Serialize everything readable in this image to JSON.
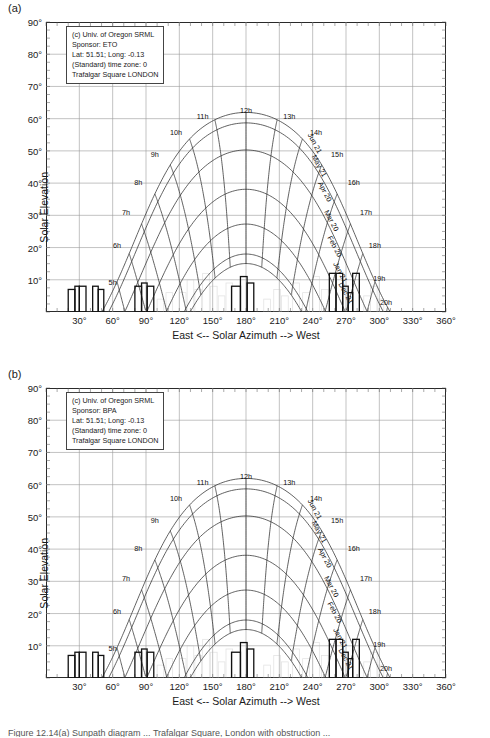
{
  "figure": {
    "caption": "Figure 12.14(a) Sunpath diagram ... Trafalgar Square, London with obstruction ..."
  },
  "panels": [
    {
      "letter": "(a)",
      "info": [
        "(c) Univ. of Oregon SRML",
        "Sponsor: ETO",
        "Lat: 51.51; Long: -0.13",
        "(Standard) time zone: 0",
        "Trafalgar Square LONDON"
      ]
    },
    {
      "letter": "(b)",
      "info": [
        "(c) Univ. of Oregon SRML",
        "Sponsor: BPA",
        "Lat: 51.51; Long: -0.13",
        "(Standard) time zone: 0",
        "Trafalgar Square LONDON"
      ]
    }
  ],
  "axes": {
    "ylabel": "Solar Elevation",
    "xlabel": "East <-- Solar Azimuth --> West",
    "yticks": [
      "90°",
      "80°",
      "70°",
      "60°",
      "50°",
      "40°",
      "30°",
      "20°",
      "10°"
    ],
    "yvalues": [
      90,
      80,
      70,
      60,
      50,
      40,
      30,
      20,
      10
    ],
    "xticks": [
      "30°",
      "60°",
      "90°",
      "120°",
      "150°",
      "180°",
      "210°",
      "240°",
      "270°",
      "300°",
      "330°",
      "360°"
    ],
    "xvalues": [
      30,
      60,
      90,
      120,
      150,
      180,
      210,
      240,
      270,
      300,
      330,
      360
    ],
    "xlim": [
      0,
      360
    ],
    "ylim": [
      0,
      90
    ]
  },
  "chart_data": {
    "type": "line",
    "xlabel": "East <-- Solar Azimuth --> West",
    "ylabel": "Solar Elevation",
    "xlim": [
      0,
      360
    ],
    "ylim": [
      0,
      90
    ],
    "grid": true,
    "legend": "none",
    "latitude": 51.51,
    "longitude": -0.13,
    "timezone": 0,
    "hour_labels": [
      "5h",
      "6h",
      "7h",
      "8h",
      "9h",
      "10h",
      "11h",
      "12h",
      "13h",
      "14h",
      "15h",
      "16h",
      "17h",
      "18h",
      "19h",
      "20h"
    ],
    "month_labels": [
      "Jun 21",
      "May 21",
      "Apr 20",
      "Mar 20",
      "Feb 20",
      "Jan 21",
      "Dec 21"
    ],
    "declinations": [
      23.45,
      20.2,
      11.8,
      -0.4,
      -11.2,
      -20.5,
      -23.45
    ],
    "obstruction_bars": [
      {
        "azimuth_start": 20,
        "azimuth_end": 26,
        "elevation": 7
      },
      {
        "azimuth_start": 26,
        "azimuth_end": 30,
        "elevation": 8
      },
      {
        "azimuth_start": 30,
        "azimuth_end": 36,
        "elevation": 8
      },
      {
        "azimuth_start": 42,
        "azimuth_end": 47,
        "elevation": 8
      },
      {
        "azimuth_start": 47,
        "azimuth_end": 52,
        "elevation": 7
      },
      {
        "azimuth_start": 80,
        "azimuth_end": 86,
        "elevation": 8
      },
      {
        "azimuth_start": 86,
        "azimuth_end": 91,
        "elevation": 9
      },
      {
        "azimuth_start": 91,
        "azimuth_end": 97,
        "elevation": 8
      },
      {
        "azimuth_start": 167,
        "azimuth_end": 175,
        "elevation": 8
      },
      {
        "azimuth_start": 175,
        "azimuth_end": 181,
        "elevation": 11
      },
      {
        "azimuth_start": 181,
        "azimuth_end": 187,
        "elevation": 9
      },
      {
        "azimuth_start": 255,
        "azimuth_end": 261,
        "elevation": 12
      },
      {
        "azimuth_start": 261,
        "azimuth_end": 267,
        "elevation": 12
      },
      {
        "azimuth_start": 267,
        "azimuth_end": 272,
        "elevation": 8
      },
      {
        "azimuth_start": 272,
        "azimuth_end": 276,
        "elevation": 6
      },
      {
        "azimuth_start": 276,
        "azimuth_end": 282,
        "elevation": 12
      }
    ]
  }
}
